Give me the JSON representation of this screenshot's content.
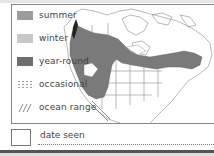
{
  "legend": {
    "items": [
      {
        "key": "summer",
        "label": "summer",
        "color": "#9c9c9c"
      },
      {
        "key": "winter",
        "label": "winter",
        "color": "#c8c8c8"
      },
      {
        "key": "year_round",
        "label": "year-round",
        "color": "#6e6e6e"
      },
      {
        "key": "occasional",
        "label": "occasional",
        "pattern": "dots"
      },
      {
        "key": "ocean_range",
        "label": "ocean range",
        "pattern": "hatch"
      }
    ]
  },
  "footer": {
    "date_label": "date seen"
  },
  "map": {
    "region": "North America",
    "range_fill_color": "#7a7a7a",
    "outline_color": "#8a8a8a"
  }
}
